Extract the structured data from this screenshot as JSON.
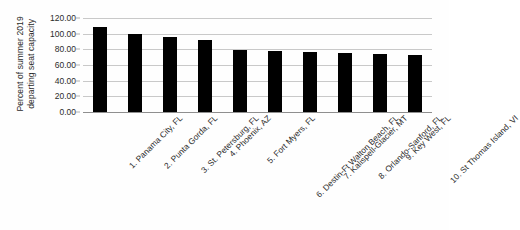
{
  "chart_data": {
    "type": "bar",
    "title": "",
    "xlabel": "",
    "ylabel": "Percent of summer 2019 departing seat capacity",
    "ylabel_lines": [
      "Percent of summer 2019",
      "departing seat capacity"
    ],
    "categories": [
      "1. Panama City, FL",
      "2. Punta Gorda, FL",
      "3. St. Petersburg, FL",
      "4. Phoenix, AZ",
      "5. Fort Myers, FL",
      "6. Destin-Ft Walton Beach, FL",
      "7. Kalispell-Glacier, MT",
      "8. Orlando-Sanford, FL",
      "9. Key West, FL",
      "10. St Thomas Island, VI"
    ],
    "values": [
      109.0,
      99.5,
      96.0,
      91.5,
      79.5,
      78.5,
      76.5,
      75.0,
      74.0,
      72.5
    ],
    "ylim": [
      0,
      120
    ],
    "ytick_step": 20,
    "ytick_labels": [
      "0.00",
      "20.00",
      "40.00",
      "60.00",
      "80.00",
      "100.00",
      "120.00"
    ],
    "ytick_values": [
      0,
      20,
      40,
      60,
      80,
      100,
      120
    ],
    "grid": true,
    "legend": false,
    "legend_position": "none",
    "bar_color": "#000000",
    "gridline_color": "#c9c9c9",
    "axis_color": "#8f8f8f",
    "background_color": "#fefefe",
    "x_label_rotation": -45
  }
}
